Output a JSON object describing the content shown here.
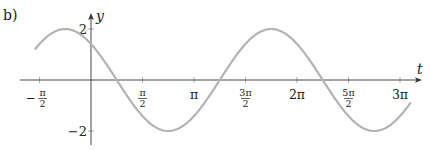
{
  "part_label": "b)",
  "chart_data": {
    "type": "line",
    "title": "",
    "xlabel": "t",
    "ylabel": "y",
    "function": "y = 2 cos(t + π/4)",
    "xlim_pi": [
      -0.54,
      3.1
    ],
    "ylim": [
      -2,
      2
    ],
    "grid": false,
    "legend": null,
    "x_ticks": [
      {
        "value_pi": -0.5,
        "label": "−π/2",
        "num": "π",
        "den": "2",
        "sign": "−"
      },
      {
        "value_pi": 0.5,
        "label": "π/2",
        "num": "π",
        "den": "2",
        "sign": ""
      },
      {
        "value_pi": 1.0,
        "label": "π",
        "num": "",
        "den": "",
        "sign": ""
      },
      {
        "value_pi": 1.5,
        "label": "3π/2",
        "num": "3π",
        "den": "2",
        "sign": ""
      },
      {
        "value_pi": 2.0,
        "label": "2π",
        "num": "",
        "den": "",
        "sign": ""
      },
      {
        "value_pi": 2.5,
        "label": "5π/2",
        "num": "5π",
        "den": "2",
        "sign": ""
      },
      {
        "value_pi": 3.0,
        "label": "3π",
        "num": "",
        "den": "",
        "sign": ""
      }
    ],
    "y_ticks": [
      {
        "value": 2,
        "label": "2"
      },
      {
        "value": -2,
        "label": "−2"
      }
    ],
    "series": [
      {
        "name": "y(t)",
        "color": "#b3b3b3",
        "amplitude": 2,
        "phase_pi": 0.25,
        "points": [
          {
            "t_pi": -0.54,
            "y": 1.23
          },
          {
            "t_pi": -0.25,
            "y": 2.0
          },
          {
            "t_pi": 0.0,
            "y": 1.41
          },
          {
            "t_pi": 0.25,
            "y": 0.0
          },
          {
            "t_pi": 0.75,
            "y": -2.0
          },
          {
            "t_pi": 1.25,
            "y": 0.0
          },
          {
            "t_pi": 1.75,
            "y": 2.0
          },
          {
            "t_pi": 2.25,
            "y": 0.0
          },
          {
            "t_pi": 2.75,
            "y": -2.0
          },
          {
            "t_pi": 3.1,
            "y": -1.18
          }
        ]
      }
    ]
  }
}
